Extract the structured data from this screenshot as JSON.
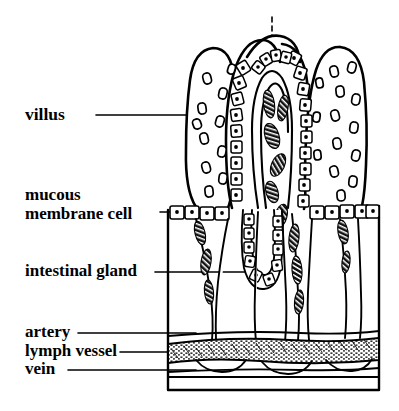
{
  "figure": {
    "kind": "anatomical-line-diagram",
    "ink_color": "#000000",
    "background_color": "#ffffff"
  },
  "labels": [
    {
      "id": "villus",
      "text": "villus",
      "lines": [
        "villus"
      ]
    },
    {
      "id": "mucous-membrane",
      "text": "mucous membrane cell",
      "lines": [
        "mucous",
        "membrane cell"
      ]
    },
    {
      "id": "intestinal-gland",
      "text": "intestinal gland",
      "lines": [
        "intestinal gland"
      ]
    },
    {
      "id": "artery",
      "text": "artery",
      "lines": [
        "artery"
      ]
    },
    {
      "id": "lymph-vessel",
      "text": "lymph vessel",
      "lines": [
        "lymph vessel"
      ]
    },
    {
      "id": "vein",
      "text": "vein",
      "lines": [
        "vein"
      ]
    }
  ],
  "structures": {
    "villi_count": 5,
    "epithelium": "columnar cells with central nuclei",
    "core_contents": "lacteal and capillary network with hatched blood cells",
    "submucosa_band": "stippled lymph vessel layer",
    "vessel_layers": [
      "artery",
      "lymph vessel",
      "vein"
    ]
  }
}
